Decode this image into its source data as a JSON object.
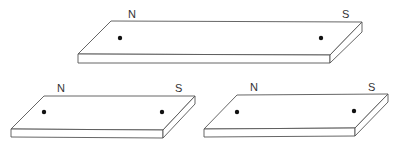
{
  "figure": {
    "magnets": [
      {
        "id": "top",
        "north_label": "N",
        "south_label": "S"
      },
      {
        "id": "bottom-left",
        "north_label": "N",
        "south_label": "S"
      },
      {
        "id": "bottom-right",
        "north_label": "N",
        "south_label": "S"
      }
    ]
  }
}
